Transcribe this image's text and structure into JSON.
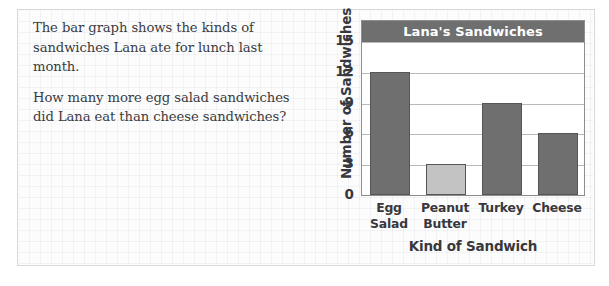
{
  "prompt": {
    "paragraphs": [
      "The bar graph shows the kinds of sandwiches Lana ate for lunch last month.",
      "How many more egg salad sandwiches did Lana eat than cheese sandwiches?"
    ]
  },
  "colors": {
    "bar_default": "#6f6f6f",
    "bar_highlight": "#c3c3c3",
    "bar_outline": "#565656",
    "title_band": "#6f6f6f",
    "title_text": "#ffffff",
    "gridline": "#b9b9b9",
    "axis": "#8d8d8d",
    "text": "#38383c"
  },
  "chart_data": {
    "type": "bar",
    "title": "Lana's Sandwiches",
    "xlabel": "Kind of Sandwich",
    "ylabel": "Number of Sandwiches",
    "categories": [
      "Egg Salad",
      "Peanut Butter",
      "Turkey",
      "Cheese"
    ],
    "category_lines": [
      [
        "Egg",
        "Salad"
      ],
      [
        "Peanut",
        "Butter"
      ],
      [
        "Turkey",
        ""
      ],
      [
        "Cheese",
        ""
      ]
    ],
    "values": [
      12,
      3,
      9,
      6
    ],
    "bar_colors": [
      "#6f6f6f",
      "#c3c3c3",
      "#6f6f6f",
      "#6f6f6f"
    ],
    "ylim": [
      0,
      15
    ],
    "yticks": [
      0,
      3,
      6,
      9,
      12,
      15
    ],
    "ytick_labels": [
      "0",
      "3",
      "6",
      "9",
      "12",
      "15"
    ],
    "grid": true,
    "legend": false
  }
}
